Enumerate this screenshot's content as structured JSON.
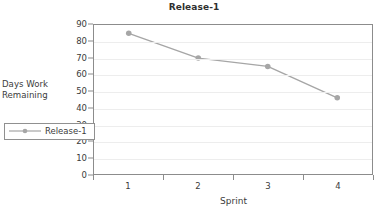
{
  "chart_data": {
    "type": "line",
    "title": "Release-1",
    "xlabel": "Sprint",
    "ylabel": "Days Work Remaining",
    "ylabel_line1": "Days Work",
    "ylabel_line2": "Remaining",
    "categories": [
      "1",
      "2",
      "3",
      "4"
    ],
    "yticks": [
      90,
      80,
      70,
      60,
      50,
      40,
      30,
      20,
      10,
      0
    ],
    "ylim": [
      0,
      90
    ],
    "grid": true,
    "legend_position": "inside-bottom-left",
    "series": [
      {
        "name": "Release-1",
        "values": [
          85,
          70,
          65,
          46
        ],
        "color": "#a6a6a6",
        "marker": "circle"
      }
    ]
  },
  "legend": {
    "entries": [
      {
        "label": "Release-1",
        "color": "#a6a6a6"
      }
    ]
  },
  "colors": {
    "series": "#a6a6a6",
    "axis": "#8c8c8c",
    "grid": "#ededed",
    "text": "#3b3b3b",
    "background": "#ffffff"
  }
}
